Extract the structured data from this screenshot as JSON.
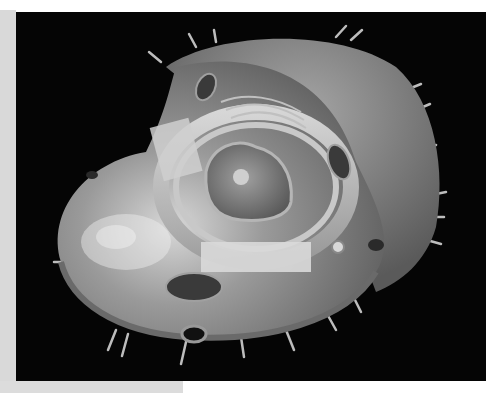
{
  "image": {
    "subject": "3D cutaway render of an animal cell",
    "palette": {
      "background": "#050505",
      "membrane": "#8a8a8a",
      "cytoplasm": "#9c9c9c",
      "highlight": "#e6e6e6",
      "nucleus": "#7a7a7a",
      "frame_border": "#d9d9d9"
    },
    "parts": [
      "cell-membrane",
      "cytoplasm",
      "nucleus",
      "nucleolus",
      "nuclear-envelope",
      "endoplasmic-reticulum",
      "golgi-apparatus",
      "mitochondrion",
      "vesicle",
      "cilia-spikes"
    ]
  }
}
